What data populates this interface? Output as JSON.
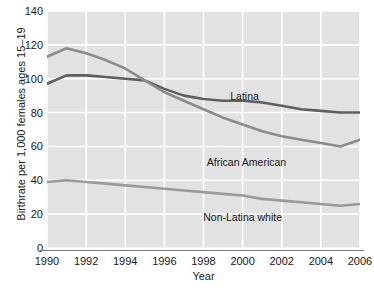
{
  "chart_data": {
    "type": "line",
    "title": "",
    "xlabel": "Year",
    "ylabel": "Birthrate per 1,000 females ages 15–19",
    "xlim": [
      1990,
      2006
    ],
    "ylim": [
      0,
      140
    ],
    "grid": true,
    "legend_position": "inline-annotations",
    "x": [
      1990,
      1991,
      1992,
      1993,
      1994,
      1995,
      1996,
      1997,
      1998,
      1999,
      2000,
      2001,
      2002,
      2003,
      2004,
      2005,
      2006
    ],
    "xticks": [
      "1990",
      "1992",
      "1994",
      "1996",
      "1998",
      "2000",
      "2002",
      "2004",
      "2006"
    ],
    "yticks": [
      "0",
      "20",
      "40",
      "60",
      "80",
      "100",
      "120",
      "140"
    ],
    "series": [
      {
        "name": "Latina",
        "color": "#5f5f5f",
        "values": [
          97,
          102,
          102,
          101,
          100,
          99,
          94,
          90,
          88,
          87,
          87,
          86,
          84,
          82,
          81,
          80,
          80
        ]
      },
      {
        "name": "African American",
        "color": "#8c8c8c",
        "values": [
          113,
          118,
          115,
          111,
          106,
          99,
          92,
          87,
          82,
          77,
          73,
          69,
          66,
          64,
          62,
          60,
          64
        ]
      },
      {
        "name": "Non-Latina white",
        "color": "#9a9a9a",
        "values": [
          39,
          40,
          39,
          38,
          37,
          36,
          35,
          34,
          33,
          32,
          31,
          29,
          28,
          27,
          26,
          25,
          26
        ]
      }
    ],
    "annotations": [
      {
        "text": "Latina",
        "x": 2000.1,
        "y": 89
      },
      {
        "text": "African American",
        "x": 2000.2,
        "y": 50
      },
      {
        "text": "Non-Latina white",
        "x": 2000.0,
        "y": 18
      }
    ],
    "colors": {
      "plot_background": "#e2e2e2",
      "gridline": "#ffffff",
      "axis": "#777777",
      "text": "#1a1a1a"
    }
  }
}
